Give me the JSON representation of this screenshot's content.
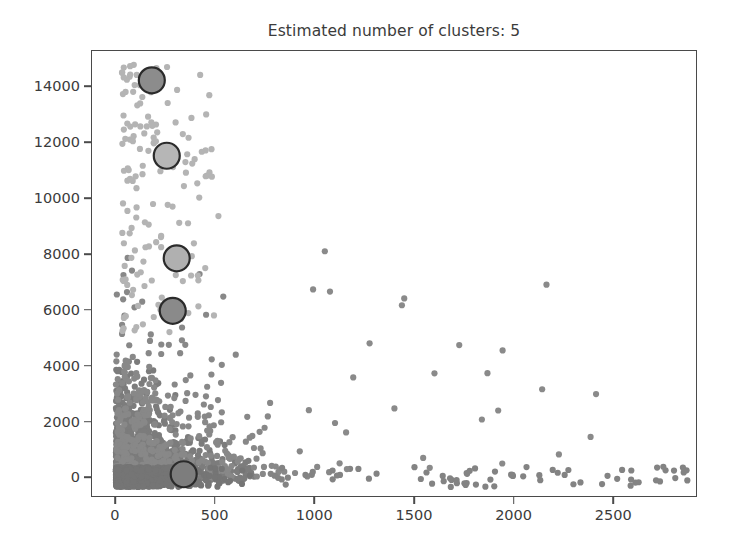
{
  "chart_data": {
    "type": "scatter",
    "title": "Estimated number of clusters: 5",
    "xlabel": "",
    "ylabel": "",
    "xlim": [
      -120,
      2920
    ],
    "ylim": [
      -700,
      15300
    ],
    "xticks": [
      0,
      500,
      1000,
      1500,
      2000,
      2500
    ],
    "xticklabels": [
      "0",
      "500",
      "1000",
      "1500",
      "2000",
      "2500"
    ],
    "yticks": [
      0,
      2000,
      4000,
      6000,
      8000,
      10000,
      12000,
      14000
    ],
    "yticklabels": [
      "0",
      "2000",
      "4000",
      "6000",
      "8000",
      "10000",
      "12000",
      "14000"
    ],
    "grid": false,
    "legend": null,
    "n_clusters": 5,
    "point_color": "#858585",
    "point_color_light": "#b4b4b4",
    "center_edge_color": "#2b2b2b",
    "frame_color": "#4a4a4a",
    "text_color": "#3b3b3b",
    "point_radius": 3.1,
    "center_radius": 13.0,
    "cluster_centers": [
      {
        "index": 0,
        "x": 180,
        "y": 14250,
        "fill": "#8c8c8c",
        "label": "cluster-center-1"
      },
      {
        "index": 1,
        "x": 255,
        "y": 11550,
        "fill": "#b6b6b6",
        "label": "cluster-center-2"
      },
      {
        "index": 2,
        "x": 305,
        "y": 7880,
        "fill": "#b0b0b0",
        "label": "cluster-center-3"
      },
      {
        "index": 3,
        "x": 285,
        "y": 6000,
        "fill": "#8a8a8a",
        "label": "cluster-center-4"
      },
      {
        "index": 4,
        "x": 340,
        "y": 150,
        "fill": "#7d7d7d",
        "label": "cluster-center-5"
      }
    ],
    "series": [
      {
        "name": "dense-core",
        "n_points": 1500,
        "color": "#7c7c7c",
        "distribution": "exponential-corner",
        "x_scale": 165,
        "y_scale": 900,
        "x_range": [
          0,
          700
        ],
        "y_range": [
          -250,
          4200
        ]
      },
      {
        "name": "mid-scatter",
        "n_points": 420,
        "color": "#888888",
        "distribution": "exponential-corner",
        "x_scale": 280,
        "y_scale": 2200,
        "x_range": [
          0,
          1100
        ],
        "y_range": [
          -250,
          8200
        ]
      },
      {
        "name": "upper-light-cluster",
        "n_points": 150,
        "color": "#b4b4b4",
        "distribution": "vertical-band",
        "x_range": [
          30,
          520
        ],
        "y_range": [
          5200,
          14900
        ]
      },
      {
        "name": "baseline-outliers",
        "n_points": 75,
        "color": "#838383",
        "distribution": "baseline",
        "x_range": [
          700,
          2870
        ],
        "y_range": [
          -320,
          420
        ]
      },
      {
        "name": "far-outliers",
        "n_points": 26,
        "color": "#8a8a8a",
        "distribution": "sparse",
        "x_range": [
          900,
          2450
        ],
        "y_range": [
          300,
          8300
        ]
      }
    ]
  }
}
